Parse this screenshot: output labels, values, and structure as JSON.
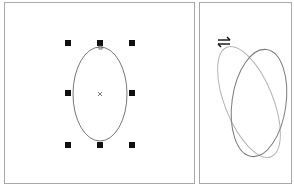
{
  "figure": {
    "left_panel": {
      "label": "selected-ellipse-with-handles",
      "ellipse": {
        "cx": 100,
        "cy": 94,
        "rx": 27,
        "ry": 47,
        "stroke": "#777777"
      },
      "center_marker": "×",
      "handles": [
        {
          "x": 68,
          "y": 43
        },
        {
          "x": 100,
          "y": 43
        },
        {
          "x": 132,
          "y": 43
        },
        {
          "x": 68,
          "y": 93
        },
        {
          "x": 132,
          "y": 93
        },
        {
          "x": 68,
          "y": 145
        },
        {
          "x": 100,
          "y": 145
        },
        {
          "x": 132,
          "y": 145
        }
      ],
      "handle_color": "#111111"
    },
    "right_panel": {
      "label": "skewed-ellipse-comparison",
      "skew_icon": "⇌",
      "ellipses": [
        {
          "name": "original",
          "stroke": "#777777"
        },
        {
          "name": "skewed",
          "stroke": "#b0b0b0"
        }
      ]
    }
  }
}
